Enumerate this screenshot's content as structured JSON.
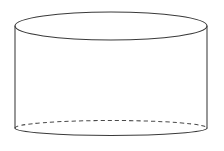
{
  "figure": {
    "shape_name": "cylinder",
    "background_color": "#ffffff",
    "stroke_color": "#3a3a3a",
    "hidden_stroke_color": "#4a4a4a",
    "stroke_width": 1.05,
    "canvas": {
      "width": 224,
      "height": 151
    },
    "geometry": {
      "top_ellipse": {
        "cx": 111,
        "cy": 26,
        "rx": 96,
        "ry": 14,
        "style": "solid"
      },
      "bottom_ellipse": {
        "cx": 111,
        "cy": 128,
        "rx": 96,
        "ry": 7.5,
        "front_style": "solid",
        "back_style": "dashed"
      },
      "left_wall": {
        "x": 15,
        "y1": 26,
        "y2": 128
      },
      "right_wall": {
        "x": 207,
        "y1": 26,
        "y2": 128
      },
      "height_px": 102,
      "diameter_px": 192
    },
    "paths": {
      "top_ellipse_full": "M 15 26 A 96 14 0 1 0 207 26 A 96 14 0 1 0 15 26 Z",
      "left_wall": "M 15 26 L 15 128",
      "right_wall": "M 207 26 L 207 128",
      "bottom_front_arc": "M 15 128 A 96 7.5 0 0 0 207 128",
      "bottom_back_arc": "M 15 128 A 96 7.5 0 0 1 207 128",
      "body_fill": "M 15 26 L 15 128 A 96 7.5 0 0 0 207 128 L 207 26 A 96 14 0 0 1 15 26 Z"
    }
  }
}
